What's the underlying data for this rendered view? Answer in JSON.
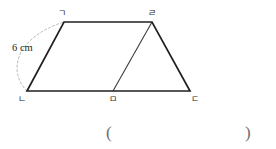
{
  "figure": {
    "type": "geometry-diagram",
    "background_color": "#ffffff",
    "outline_color": "#231f20",
    "interior_line_color": "#3c3c3c",
    "arc_color": "#b9b9b9",
    "vertices": [
      {
        "name": "vertex-top-left",
        "label": "ㄱ",
        "x": 64,
        "y": 22,
        "label_x": 58,
        "label_y": 9
      },
      {
        "name": "vertex-top-right",
        "label": "ㄹ",
        "x": 152,
        "y": 22,
        "label_x": 148,
        "label_y": 9
      },
      {
        "name": "vertex-bottom-right",
        "label": "ㄷ",
        "x": 190,
        "y": 91,
        "label_x": 191,
        "label_y": 95
      },
      {
        "name": "vertex-bottom-mid",
        "label": "ㅁ",
        "x": 113,
        "y": 91,
        "label_x": 109,
        "label_y": 95
      },
      {
        "name": "vertex-bottom-left",
        "label": "ㄴ",
        "x": 27,
        "y": 91,
        "label_x": 18,
        "label_y": 95
      }
    ],
    "outline_path": "M 64 22 L 152 22 L 190 91 L 27 91 Z",
    "interior_segment": {
      "from": "vertex-bottom-mid",
      "to": "vertex-top-right",
      "path": "M 113 91 L 152 22"
    },
    "dimension_arc": {
      "path": "M 27 91 C 8 72 14 38 64 22",
      "label": "6 cm",
      "label_x": 12,
      "label_y": 43
    }
  },
  "answer_blank": {
    "open_paren": "(",
    "close_paren": ")"
  }
}
